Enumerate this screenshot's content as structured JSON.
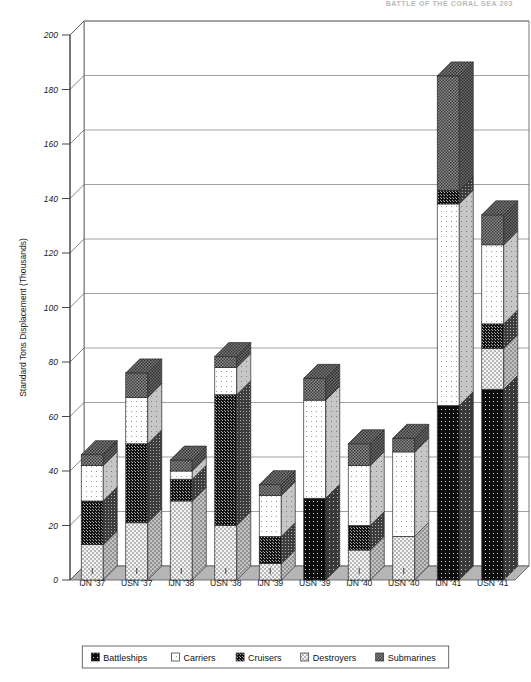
{
  "page": {
    "running_header": "BATTLE OF THE CORAL SEA        203"
  },
  "chart_data": {
    "type": "bar",
    "subtype": "stacked-column-3d",
    "title": "",
    "xlabel": "",
    "ylabel": "Standard Tons Displacement (Thousands)",
    "ylim": [
      0,
      200
    ],
    "ytick_step": 20,
    "yticks": [
      0,
      20,
      40,
      60,
      80,
      100,
      120,
      140,
      160,
      180,
      200
    ],
    "ytick_labels": [
      "0",
      "20",
      "40",
      "60",
      "80",
      "100",
      "120",
      "140",
      "160",
      "180",
      "200"
    ],
    "grid": true,
    "legend_position": "bottom",
    "categories": [
      "IJN '37",
      "USN '37",
      "IJN '38",
      "USN '38",
      "IJN '39",
      "USN '39",
      "IJN '40",
      "USN '40",
      "IJN '41",
      "USN '41"
    ],
    "series": [
      {
        "name": "Battleships",
        "pattern": "solid-dark",
        "values": [
          0,
          0,
          0,
          0,
          0,
          30,
          0,
          0,
          64,
          70
        ]
      },
      {
        "name": "Carriers",
        "pattern": "open",
        "values": [
          0,
          0,
          0,
          0,
          0,
          36,
          0,
          0,
          74,
          0
        ]
      },
      {
        "name": "Cruisers",
        "pattern": "dark-fine",
        "values": [
          16,
          29,
          9,
          48,
          10,
          0,
          9,
          0,
          5,
          9
        ]
      },
      {
        "name": "Destroyers",
        "pattern": "light-dot",
        "values": [
          13,
          21,
          29,
          20,
          6,
          0,
          11,
          16,
          0,
          15
        ]
      },
      {
        "name": "Submarines",
        "pattern": "mid-check",
        "values": [
          4,
          10,
          2,
          3,
          3,
          8,
          4,
          5,
          4,
          11
        ]
      }
    ],
    "stack_order": [
      "Battleships",
      "Destroyers",
      "Cruisers",
      "Carriers",
      "Submarines"
    ],
    "bar_stacks": [
      {
        "category": "IJN '37",
        "segments": [
          {
            "series": "Destroyers",
            "value": 13
          },
          {
            "series": "Cruisers",
            "value": 16
          },
          {
            "series": "Carriers",
            "value": 13
          },
          {
            "series": "Submarines",
            "value": 4
          }
        ],
        "total": 46
      },
      {
        "category": "USN '37",
        "segments": [
          {
            "series": "Destroyers",
            "value": 21
          },
          {
            "series": "Cruisers",
            "value": 29
          },
          {
            "series": "Carriers",
            "value": 17
          },
          {
            "series": "Submarines",
            "value": 9
          }
        ],
        "total": 76
      },
      {
        "category": "IJN '38",
        "segments": [
          {
            "series": "Destroyers",
            "value": 29
          },
          {
            "series": "Cruisers",
            "value": 8
          },
          {
            "series": "Carriers",
            "value": 3
          },
          {
            "series": "Submarines",
            "value": 4
          }
        ],
        "total": 44
      },
      {
        "category": "USN '38",
        "segments": [
          {
            "series": "Destroyers",
            "value": 20
          },
          {
            "series": "Cruisers",
            "value": 48
          },
          {
            "series": "Carriers",
            "value": 10
          },
          {
            "series": "Submarines",
            "value": 4
          }
        ],
        "total": 82
      },
      {
        "category": "IJN '39",
        "segments": [
          {
            "series": "Destroyers",
            "value": 6
          },
          {
            "series": "Cruisers",
            "value": 10
          },
          {
            "series": "Carriers",
            "value": 15
          },
          {
            "series": "Submarines",
            "value": 4
          }
        ],
        "total": 35
      },
      {
        "category": "USN '39",
        "segments": [
          {
            "series": "Battleships",
            "value": 30
          },
          {
            "series": "Carriers",
            "value": 36
          },
          {
            "series": "Submarines",
            "value": 8
          }
        ],
        "total": 74
      },
      {
        "category": "IJN '40",
        "segments": [
          {
            "series": "Destroyers",
            "value": 11
          },
          {
            "series": "Cruisers",
            "value": 9
          },
          {
            "series": "Carriers",
            "value": 22
          },
          {
            "series": "Submarines",
            "value": 8
          }
        ],
        "total": 50
      },
      {
        "category": "USN '40",
        "segments": [
          {
            "series": "Destroyers",
            "value": 16
          },
          {
            "series": "Carriers",
            "value": 31
          },
          {
            "series": "Submarines",
            "value": 5
          }
        ],
        "total": 52
      },
      {
        "category": "IJN '41",
        "segments": [
          {
            "series": "Battleships",
            "value": 64
          },
          {
            "series": "Carriers",
            "value": 74
          },
          {
            "series": "Cruisers",
            "value": 5
          },
          {
            "series": "Submarines",
            "value": 42
          }
        ],
        "total": 185
      },
      {
        "category": "USN '41",
        "segments": [
          {
            "series": "Battleships",
            "value": 70
          },
          {
            "series": "Destroyers",
            "value": 15
          },
          {
            "series": "Cruisers",
            "value": 9
          },
          {
            "series": "Carriers",
            "value": 29
          },
          {
            "series": "Submarines",
            "value": 11
          }
        ],
        "total": 134
      }
    ],
    "legend": [
      {
        "label": "Battleships",
        "pattern": "solid-dark"
      },
      {
        "label": "Carriers",
        "pattern": "open"
      },
      {
        "label": "Cruisers",
        "pattern": "dark-fine"
      },
      {
        "label": "Destroyers",
        "pattern": "light-dot"
      },
      {
        "label": "Submarines",
        "pattern": "mid-check"
      }
    ],
    "colors": {
      "battleships": "#101010",
      "carriers": "#fefefe",
      "cruisers": "#1c1c1c",
      "destroyers": "#f2f2f2",
      "submarines": "#8a8a8a",
      "axis": "#555555",
      "grid": "#777777",
      "floor": "#b5b5b5"
    }
  }
}
